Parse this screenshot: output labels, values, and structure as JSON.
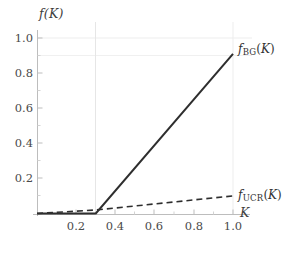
{
  "figure": {
    "background": "#ffffff",
    "ink_color": "#333333",
    "grid_color": "#e8e8e8",
    "axis_color": "#c9c9c9"
  },
  "axes": {
    "y_axis_title": "f(K)",
    "x_axis_title": "K",
    "x_ticks": [
      "0.2",
      "0.4",
      "0.6",
      "0.8",
      "1.0"
    ],
    "y_ticks": [
      "0.2",
      "0.4",
      "0.6",
      "0.8",
      "1.0"
    ]
  },
  "labels": {
    "bg": {
      "symbol": "f",
      "subscript": "BG",
      "arg": "(K)"
    },
    "ucr": {
      "symbol": "f",
      "subscript": "UCR",
      "arg": "(K)"
    }
  },
  "chart_data": {
    "type": "line",
    "title": "",
    "xlabel": "K",
    "ylabel": "f(K)",
    "xlim": [
      0.0,
      1.0
    ],
    "ylim": [
      0.0,
      1.0
    ],
    "xticks": [
      0.2,
      0.4,
      0.6,
      0.8,
      1.0
    ],
    "yticks": [
      0.2,
      0.4,
      0.6,
      0.8,
      1.0
    ],
    "grid": true,
    "gridlines": {
      "vertical": [
        0.3,
        1.0
      ],
      "horizontal": [
        0.9,
        1.0
      ]
    },
    "legend": "inline-end-of-curve",
    "series": [
      {
        "name": "f_BG(K)",
        "style": "solid",
        "color": "#2e2e2e",
        "width": 2.0,
        "points": [
          {
            "x": 0.0,
            "y": 0.0
          },
          {
            "x": 0.3,
            "y": 0.0
          },
          {
            "x": 1.0,
            "y": 0.91
          }
        ],
        "description": "Zero until K = 0.3, then rises linearly to 0.91 at K = 1.0"
      },
      {
        "name": "f_UCR(K)",
        "style": "dashed",
        "color": "#2e2e2e",
        "width": 1.6,
        "points": [
          {
            "x": 0.0,
            "y": 0.0
          },
          {
            "x": 0.3,
            "y": 0.02
          },
          {
            "x": 1.0,
            "y": 0.1
          }
        ],
        "description": "Rises slowly and nearly linearly from 0 to about 0.10 at K = 1.0"
      }
    ]
  }
}
